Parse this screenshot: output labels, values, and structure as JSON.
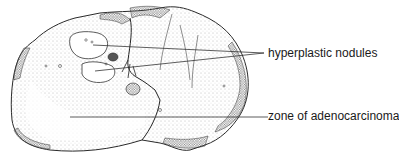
{
  "figure": {
    "labels": [
      {
        "id": "hyperplastic",
        "text": "hyperplastic nodules",
        "x": 268,
        "y": 46
      },
      {
        "id": "adenocarcinoma",
        "text": "zone of adenocarcinoma",
        "x": 268,
        "y": 109
      }
    ],
    "colors": {
      "line": "#2a2a2a",
      "stipple": "#8a8a8a",
      "dense": "#555555"
    }
  }
}
